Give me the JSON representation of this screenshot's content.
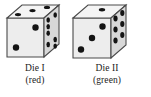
{
  "figure": {
    "name": "two-dice-illustration",
    "background_color": "#ffffff"
  },
  "style": {
    "face_top_color": "#f2f2f2",
    "face_front_color": "#ededed",
    "face_right_color": "#d6d6d6",
    "edge_color": "#4a4a4a",
    "pip_color": "#141414",
    "caption_color": "#1a1a1a"
  },
  "dice": [
    {
      "id": "die-1",
      "label": "Die I",
      "color_name": "(red)",
      "faces": {
        "front": {
          "pips": 2,
          "positions": [
            [
              0.74,
              0.24
            ],
            [
              0.26,
              0.76
            ]
          ]
        },
        "top": {
          "pips": 3,
          "positions": [
            [
              0.22,
              0.62
            ],
            [
              0.52,
              0.44
            ],
            [
              0.82,
              0.26
            ]
          ]
        },
        "right": {
          "pips": 6,
          "positions": [
            [
              0.3,
              0.2
            ],
            [
              0.3,
              0.33
            ],
            [
              0.3,
              0.46
            ],
            [
              0.72,
              0.4
            ],
            [
              0.72,
              0.53
            ],
            [
              0.72,
              0.66
            ]
          ]
        }
      }
    },
    {
      "id": "die-2",
      "label": "Die II",
      "color_name": "(green)",
      "faces": {
        "front": {
          "pips": 3,
          "positions": [
            [
              0.78,
              0.2
            ],
            [
              0.5,
              0.5
            ],
            [
              0.22,
              0.8
            ]
          ]
        },
        "top": {
          "pips": 1,
          "positions": [
            [
              0.56,
              0.48
            ]
          ]
        },
        "right": {
          "pips": 6,
          "positions": [
            [
              0.3,
              0.18
            ],
            [
              0.3,
              0.4
            ],
            [
              0.3,
              0.62
            ],
            [
              0.72,
              0.3
            ],
            [
              0.72,
              0.52
            ],
            [
              0.72,
              0.74
            ]
          ]
        }
      }
    }
  ],
  "captions": [
    {
      "name": "Die I",
      "color": "(red)"
    },
    {
      "name": "Die II",
      "color": "(green)"
    }
  ]
}
